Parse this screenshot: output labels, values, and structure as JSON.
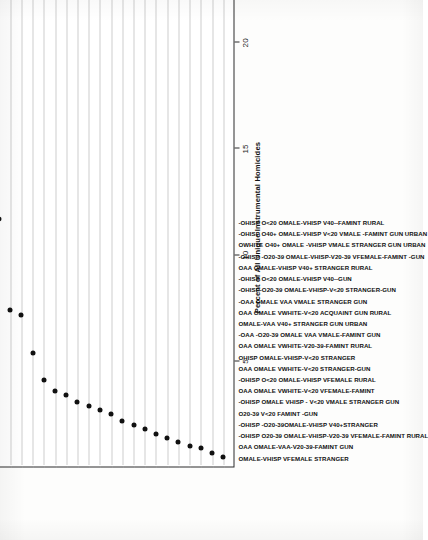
{
  "chart_data": {
    "type": "scatter",
    "title": "",
    "xlabel": "Percent of All Unique Instrumental Homicides",
    "ylabel": "",
    "xlim": [
      0,
      22.6
    ],
    "xticks": [
      5,
      10,
      15,
      20
    ],
    "xticklabels": [
      "5",
      "10",
      "15",
      "20"
    ],
    "grid": "dotted horizontal guides per category",
    "legend": "none",
    "orientation": "rotated-90-ccw",
    "categories": [
      "OMALE-VHISP VFEMALE STRANGER",
      "OAA OMALE-VAA-V20-39-FAMINT GUN",
      "-OHISP O20-39 OMALE-VHISP-V20-39 VFEMALE-FAMINT RURAL",
      "-OHISP -O20-39OMALE-VHISP V40+STRANGER",
      "O20-39 V<20 FAMINT -GUN",
      "-OHISP OMALE VHISP - V<20 VMALE STRANGER GUN",
      "OAA OMALE VWHITE-V<20 VFEMALE-FAMINT",
      "-OHISP O<20 OMALE-VHISP VFEMALE RURAL",
      "OAA OMALE VWHITE-V<20 STRANGER-GUN",
      "OHISP OMALE-VHISP-V<20 STRANGER",
      "OAA OMALE VWHITE-V20-39-FAMINT RURAL",
      "-OAA -O20-39 OMALE VAA VMALE-FAMINT GUN",
      "OMALE-VAA V40+ STRANGER GUN URBAN",
      "OAA OMALE VWHITE-V<20 ACQUAINT GUN RURAL",
      "-OAA OMALE VAA VMALE STRANGER GUN",
      "-OHISP-O20-39 OMALE-VHISP-V<20 STRANGER-GUN",
      "-OHISP O<20 OMALE-VHISP V40--GUN",
      "OAA OMALE-VHISP V40+ STRANGER RURAL",
      "-OHISP -O20-39 OMALE-VHISP-V20-39 VFEMALE-FAMINT -GUN",
      "OWHITE O40+ OMALE -VHISP VMALE STRANGER GUN URBAN",
      "-OHISP O40+ OMALE-VHISP V<20 VMALE -FAMINT GUN URBAN",
      "-OHISP O<20 OMALE-VHISP V40--FAMINT RURAL"
    ],
    "values": [
      22.0,
      11.7,
      7.4,
      7.2,
      5.4,
      4.1,
      3.6,
      3.4,
      3.1,
      2.9,
      2.7,
      2.5,
      2.2,
      2.0,
      1.8,
      1.6,
      1.4,
      1.2,
      1.0,
      0.9,
      0.7,
      0.5
    ]
  },
  "axis": {
    "x_title": "Percent of All Unique Instrumental Homicides",
    "tick_5": "5",
    "tick_10": "10",
    "tick_15": "15",
    "tick_20": "20"
  }
}
